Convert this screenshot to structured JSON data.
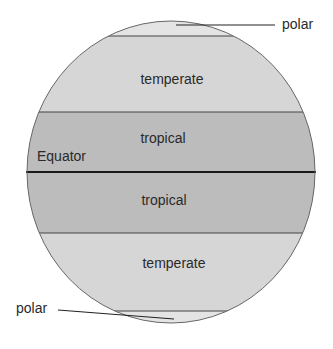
{
  "colors": {
    "polar": "#e4e4e4",
    "temperate": "#d6d6d6",
    "tropical": "#bcbcbc",
    "line": "#333333",
    "equator_line": "#1a1a1a"
  },
  "zones": [
    {
      "id": "polar-north",
      "label": "polar"
    },
    {
      "id": "temperate-north",
      "label": "temperate"
    },
    {
      "id": "tropical-north",
      "label": "tropical"
    },
    {
      "id": "tropical-south",
      "label": "tropical"
    },
    {
      "id": "temperate-south",
      "label": "temperate"
    },
    {
      "id": "polar-south",
      "label": "polar"
    }
  ],
  "equator_label": "Equator"
}
